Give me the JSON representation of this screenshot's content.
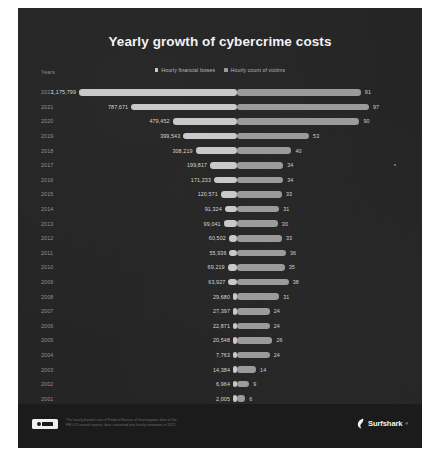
{
  "poster": {
    "title": "Yearly growth of cybercrime costs",
    "years_axis_label": "Years",
    "legend": [
      {
        "label": "Hourly financial losses",
        "color": "#c9c9c9",
        "icon": "square-swatch-icon"
      },
      {
        "label": "Hourly count of victims",
        "color": "#9b9b9b",
        "icon": "square-swatch-icon"
      }
    ],
    "footer": {
      "license_badge": "CC BY",
      "note_line1": "The hourly based costs of Federal Bureau of Investigation data of the",
      "note_line2": "FBI IC3 annual reports; data converted into hourly estimates in 2022.",
      "brand": "Surfshark",
      "brand_tm": "®"
    }
  },
  "chart_data": {
    "type": "bar",
    "subtype": "diverging-bar",
    "title": "Yearly growth of cybercrime costs",
    "xlabel": "",
    "ylabel": "Years",
    "grid": false,
    "legend_position": "top-center",
    "categories": [
      "2022",
      "2021",
      "2020",
      "2019",
      "2018",
      "2017",
      "2016",
      "2015",
      "2014",
      "2013",
      "2012",
      "2011",
      "2010",
      "2009",
      "2008",
      "2007",
      "2006",
      "2005",
      "2004",
      "2003",
      "2002",
      "2001"
    ],
    "series": [
      {
        "name": "Hourly financial losses",
        "color": "#c9c9c9",
        "unit": "USD per hour",
        "values": [
          1175799,
          787671,
          479452,
          399543,
          308219,
          199817,
          171233,
          120571,
          91324,
          99041,
          60502,
          55936,
          69219,
          63927,
          29680,
          27397,
          22871,
          20548,
          7763,
          14384,
          6964,
          2005
        ],
        "labels": [
          "1,175,799",
          "787,671",
          "479,452",
          "399,543",
          "308,219",
          "199,817",
          "171,233",
          "120,571",
          "91,324",
          "99,041",
          "60,502",
          "55,936",
          "69,219",
          "63,927",
          "29,680",
          "27,397",
          "22,871",
          "20,548",
          "7,763",
          "14,384",
          "6,964",
          "2,005"
        ]
      },
      {
        "name": "Hourly count of victims",
        "color": "#9b9b9b",
        "unit": "victims per hour",
        "values": [
          91,
          97,
          90,
          53,
          40,
          34,
          34,
          33,
          31,
          30,
          33,
          36,
          35,
          38,
          31,
          24,
          24,
          26,
          24,
          14,
          9,
          6
        ],
        "labels": [
          "91",
          "97",
          "90",
          "53",
          "40",
          "34",
          "34",
          "33",
          "31",
          "30",
          "33",
          "36",
          "35",
          "38",
          "31",
          "24",
          "24",
          "26",
          "24",
          "14",
          "9",
          "6"
        ]
      }
    ],
    "xlim_left": [
      0,
      1175799
    ],
    "xlim_right": [
      0,
      97
    ]
  }
}
